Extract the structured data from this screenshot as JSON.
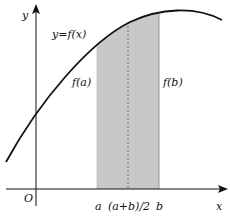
{
  "diagram": {
    "function_label": "y=f(x)",
    "axis_x_label": "x",
    "axis_y_label": "y",
    "origin_label": "O",
    "label_fa": "f(a)",
    "label_fb": "f(b)",
    "tick_a": "a",
    "tick_mid": "(a+b)/2",
    "tick_b": "b",
    "colors": {
      "shade": "#c8c8c8",
      "curve": "#111111",
      "axes": "#111111"
    }
  }
}
